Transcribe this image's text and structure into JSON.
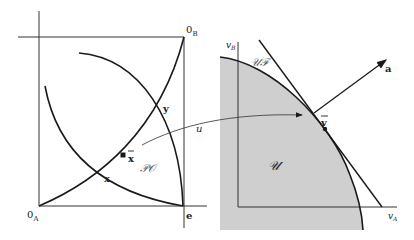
{
  "figure": {
    "left_panel": {
      "origin_A_label": "0",
      "origin_A_sub": "A",
      "origin_B_label": "0",
      "origin_B_sub": "B",
      "endowment_label": "e",
      "point_x_label": "x",
      "point_y_label": "y",
      "point_xbar_label": "x",
      "pareto_set_label": "𝒫𝒪"
    },
    "mapping": {
      "u_label": "u"
    },
    "right_panel": {
      "axis_vB_label": "v",
      "axis_vB_sub": "B",
      "axis_vA_label": "v",
      "axis_vA_sub": "A",
      "frontier_label": "𝒰ℱ",
      "set_label": "𝒰",
      "point_vbar_label": "v",
      "vector_a_label": "a"
    },
    "colors": {
      "line": "#1a1a1a",
      "axis": "#333333",
      "shade": "#cfcfcf",
      "thin": "#555555"
    }
  }
}
